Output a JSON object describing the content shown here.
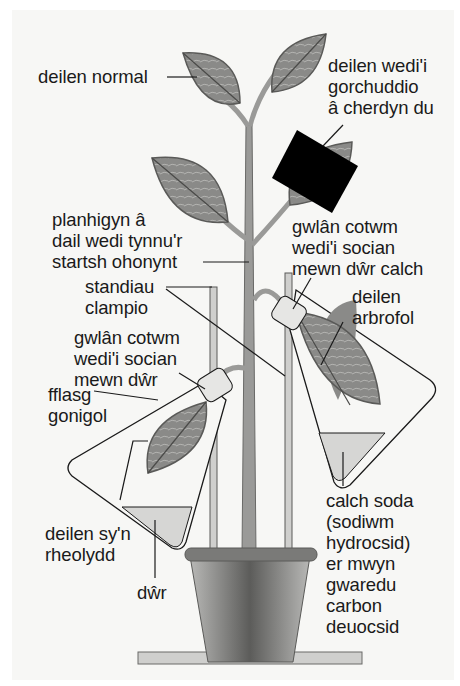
{
  "diagram": {
    "colors": {
      "background": "#f7f7f5",
      "leaf_fill": "#8a8a88",
      "leaf_outline": "#5a5a58",
      "stem": "#9a9a98",
      "card": "#000000",
      "liquid": "#d6d6d4",
      "pot_dark": "#5c5c5a",
      "pot_light": "#b8b8b6",
      "line": "#1a1a1a"
    },
    "labels": {
      "normal_leaf": "deilen normal",
      "covered_leaf": "deilen wedi'i\ngorchuddio\nâ cherdyn du",
      "destarched_plant": "planhigyn â\ndail wedi tynnu'r\nstartsh ohonynt",
      "cotton_wool_limewater": "gwlân cotwm\nwedi'i socian\nmewn dŵr calch",
      "clamp_stands": "standiau\nclampio",
      "experimental_leaf": "deilen\narbrofol",
      "cotton_wool_water": "gwlân cotwm\nwedi'i socian\nmewn dŵr",
      "conical_flask": "fflasg\ngonigol",
      "control_leaf": "deilen sy'n\nrheolydd",
      "water": "dŵr",
      "soda_lime": "calch soda\n(sodiwm\nhydrocsid)\ner mwyn\ngwaredu\ncarbon\ndeuocsid"
    }
  }
}
